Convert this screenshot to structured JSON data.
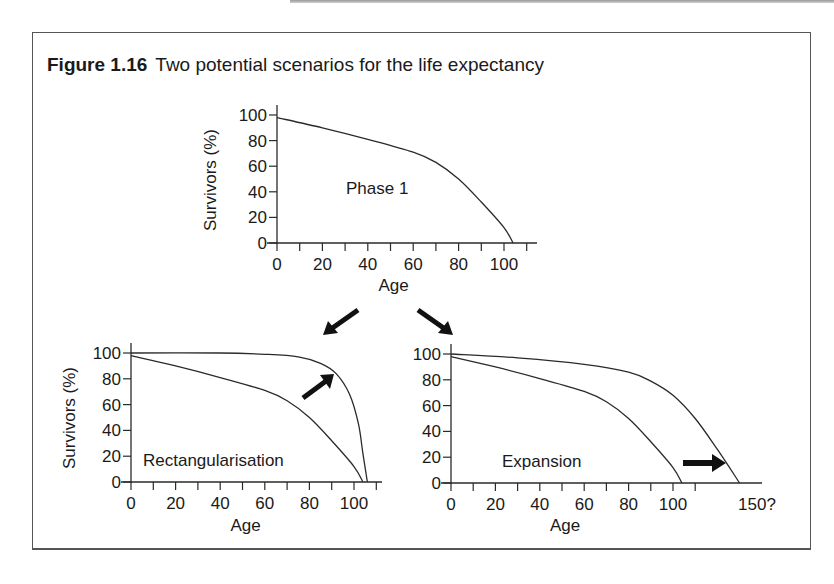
{
  "figure": {
    "number": "Figure 1.16",
    "title": "Two potential scenarios for the life expectancy"
  },
  "chart_data": [
    {
      "type": "line",
      "panel": "top",
      "annotation": "Phase 1",
      "xlabel": "Age",
      "ylabel": "Survivors (%)",
      "xticks": [
        0,
        20,
        40,
        60,
        80,
        100
      ],
      "yticks": [
        0,
        20,
        40,
        60,
        80,
        100
      ],
      "xlim": [
        0,
        114
      ],
      "ylim": [
        0,
        100
      ],
      "series": [
        {
          "name": "Phase 1",
          "x": [
            0,
            20,
            40,
            60,
            70,
            80,
            90,
            100,
            104
          ],
          "y": [
            98,
            90,
            81,
            71,
            63,
            50,
            32,
            12,
            0
          ]
        }
      ]
    },
    {
      "type": "line",
      "panel": "bottom-left",
      "annotation": "Rectangularisation",
      "xlabel": "Age",
      "ylabel": "Survivors (%)",
      "xticks": [
        0,
        20,
        40,
        60,
        80,
        100
      ],
      "yticks": [
        0,
        20,
        40,
        60,
        80,
        100
      ],
      "xlim": [
        0,
        112
      ],
      "ylim": [
        0,
        100
      ],
      "series": [
        {
          "name": "Phase 1",
          "x": [
            0,
            20,
            40,
            60,
            70,
            80,
            90,
            100,
            104
          ],
          "y": [
            98,
            90,
            81,
            71,
            63,
            50,
            32,
            12,
            0
          ]
        },
        {
          "name": "Rectangularised",
          "x": [
            0,
            40,
            60,
            75,
            85,
            92,
            98,
            102,
            104,
            106
          ],
          "y": [
            100,
            100,
            99,
            97,
            92,
            84,
            68,
            45,
            22,
            0
          ]
        }
      ]
    },
    {
      "type": "line",
      "panel": "bottom-right",
      "annotation": "Expansion",
      "xlabel": "Age",
      "ylabel": "Survivors (%)",
      "xticks": [
        0,
        20,
        40,
        60,
        80,
        100
      ],
      "xtick_extra_label": "150?",
      "yticks": [
        0,
        20,
        40,
        60,
        80,
        100
      ],
      "xlim": [
        0,
        139
      ],
      "ylim": [
        0,
        100
      ],
      "series": [
        {
          "name": "Phase 1",
          "x": [
            0,
            20,
            40,
            60,
            70,
            80,
            90,
            100,
            104
          ],
          "y": [
            98,
            90,
            81,
            71,
            63,
            50,
            32,
            12,
            0
          ]
        },
        {
          "name": "Expanded",
          "x": [
            0,
            30,
            60,
            80,
            90,
            100,
            110,
            120,
            130
          ],
          "y": [
            100,
            97,
            92,
            86,
            79,
            68,
            50,
            26,
            0
          ]
        }
      ]
    }
  ]
}
